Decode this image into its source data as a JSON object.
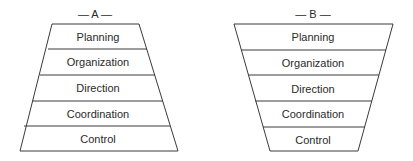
{
  "diagrams": [
    {
      "title": "— A —",
      "shape": "trapezoid-widening-downward",
      "layers": [
        "Planning",
        "Organization",
        "Direction",
        "Coordination",
        "Control"
      ]
    },
    {
      "title": "— B —",
      "shape": "trapezoid-narrowing-downward",
      "layers": [
        "Planning",
        "Organization",
        "Direction",
        "Coordination",
        "Control"
      ]
    }
  ],
  "colors": {
    "line": "#3a3a3a",
    "text": "#2a2a2a",
    "background": "#ffffff"
  }
}
